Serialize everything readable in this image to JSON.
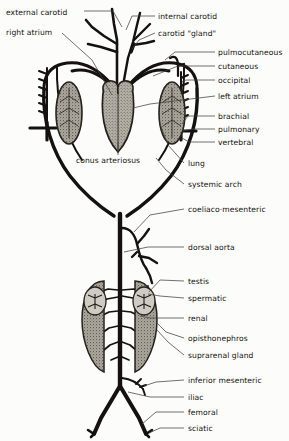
{
  "figure": {
    "colors": {
      "ink": "#14110e",
      "paper": "#fcfcfa",
      "organ_fill": "#a8a49a",
      "organ_stroke": "#2a2621",
      "leader": "#4a4views"
    }
  },
  "labels": {
    "external_carotid": "external carotid",
    "right_atrium": "right atrium",
    "internal_carotid": "internal carotid",
    "carotid_gland": "carotid \"gland\"",
    "pulmocutaneous": "pulmocutaneous",
    "cutaneous": "cutaneous",
    "occipital": "occipital",
    "left_atrium": "left atrium",
    "brachial": "brachial",
    "pulmonary": "pulmonary",
    "vertebral": "vertebral",
    "conus_arteriosus": "conus arteriosus",
    "lung": "lung",
    "systemic_arch": "systemic arch",
    "coeliaco_mesenteric": "coeliaco·mesenteric",
    "dorsal_aorta": "dorsal aorta",
    "testis": "testis",
    "spermatic": "spermatic",
    "renal": "renal",
    "opisthonephros": "opisthonephros",
    "suprarenal_gland": "suprarenal gland",
    "inferior_mesenteric": "inferior mesenteric",
    "iliac": "iliac",
    "femoral": "femoral",
    "sciatic": "sciatic"
  },
  "label_positions": {
    "external_carotid": {
      "x": 6,
      "y": 12
    },
    "right_atrium": {
      "x": 6,
      "y": 31
    },
    "internal_carotid": {
      "x": 158,
      "y": 18
    },
    "carotid_gland": {
      "x": 158,
      "y": 35
    },
    "pulmocutaneous": {
      "x": 218,
      "y": 54
    },
    "cutaneous": {
      "x": 218,
      "y": 68
    },
    "occipital": {
      "x": 218,
      "y": 82
    },
    "left_atrium": {
      "x": 218,
      "y": 98
    },
    "brachial": {
      "x": 218,
      "y": 118
    },
    "pulmonary": {
      "x": 218,
      "y": 131
    },
    "vertebral": {
      "x": 218,
      "y": 144
    },
    "conus_arteriosus": {
      "x": 76,
      "y": 161
    },
    "lung": {
      "x": 186,
      "y": 165
    },
    "systemic_arch": {
      "x": 186,
      "y": 186
    },
    "coeliaco_mesenteric": {
      "x": 186,
      "y": 211
    },
    "dorsal_aorta": {
      "x": 186,
      "y": 249
    },
    "testis": {
      "x": 186,
      "y": 283
    },
    "spermatic": {
      "x": 186,
      "y": 300
    },
    "renal": {
      "x": 186,
      "y": 320
    },
    "opisthonephros": {
      "x": 186,
      "y": 340
    },
    "suprarenal_gland": {
      "x": 186,
      "y": 357
    },
    "inferior_mesenteric": {
      "x": 186,
      "y": 382
    },
    "iliac": {
      "x": 186,
      "y": 399
    },
    "femoral": {
      "x": 186,
      "y": 414
    },
    "sciatic": {
      "x": 186,
      "y": 430
    }
  },
  "structures": {
    "heart": "heart-ventricle",
    "left_lung": "left-lung",
    "right_lung": "right-lung",
    "left_kidney": "left-opisthonephros",
    "right_kidney": "right-opisthonephros",
    "left_testis": "left-testis",
    "right_testis": "right-testis"
  }
}
